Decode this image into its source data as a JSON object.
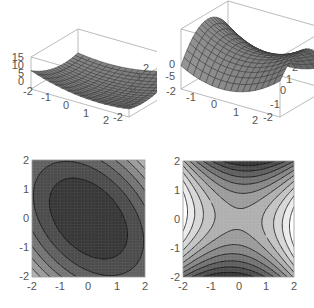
{
  "chart_data": [
    {
      "type": "surface3d",
      "id": "top-left",
      "description": "Convex bowl-shaped surface (elliptic paraboloid with cross term)",
      "x_ticks": [
        "-2",
        "-1",
        "0",
        "1",
        "2"
      ],
      "y_ticks": [
        "-2",
        "-1",
        "0",
        "1",
        "2"
      ],
      "z_ticks": [
        "0",
        "5",
        "10",
        "15"
      ],
      "xrange": [
        -2,
        2
      ],
      "yrange": [
        -2,
        2
      ],
      "zrange": [
        0,
        15
      ],
      "grid": true
    },
    {
      "type": "surface3d",
      "id": "top-right",
      "description": "Saddle-shaped surface",
      "x_ticks": [
        "-2",
        "-1",
        "0",
        "1",
        "2"
      ],
      "y_ticks": [
        "-2",
        "-1",
        "0",
        "1",
        "2"
      ],
      "z_ticks": [
        "-5",
        "0"
      ],
      "xrange": [
        -2,
        2
      ],
      "yrange": [
        -2,
        2
      ],
      "grid": true
    },
    {
      "type": "contour",
      "id": "bottom-left",
      "description": "Elliptical contours tilted diagonally, minimum near center (darkest)",
      "x_ticks": [
        "-2",
        "-1",
        "0",
        "1",
        "2"
      ],
      "y_ticks": [
        "-2",
        "-1",
        "0",
        "1",
        "2"
      ],
      "xrange": [
        -2,
        2
      ],
      "yrange": [
        -2,
        2
      ]
    },
    {
      "type": "contour",
      "id": "bottom-right",
      "description": "Hyperbolic saddle contours; dark at top/bottom, light at left/right",
      "x_ticks": [
        "-2",
        "-1",
        "0",
        "1",
        "2"
      ],
      "y_ticks": [
        "-2",
        "-1",
        "0",
        "1",
        "2"
      ],
      "xrange": [
        -2,
        2
      ],
      "yrange": [
        -2,
        2
      ]
    }
  ],
  "labels": {
    "tl_z": [
      "15",
      "10",
      "5",
      "0"
    ],
    "tl_x": [
      "-2",
      "-1",
      "0",
      "1",
      "2"
    ],
    "tl_y": [
      "2",
      "1",
      "0",
      "-1",
      "-2"
    ],
    "tr_z": [
      "0",
      "-5"
    ],
    "tr_x": [
      "-2",
      "-1",
      "0",
      "1",
      "2"
    ],
    "tr_y": [
      "2",
      "1",
      "0",
      "-1",
      "-2"
    ],
    "bl_x": [
      "-2",
      "-1",
      "0",
      "1",
      "2"
    ],
    "bl_y": [
      "2",
      "1",
      "0",
      "-1",
      "-2"
    ],
    "br_x": [
      "-2",
      "-1",
      "0",
      "1",
      "2"
    ],
    "br_y": [
      "2",
      "1",
      "0",
      "-1",
      "-2"
    ]
  }
}
